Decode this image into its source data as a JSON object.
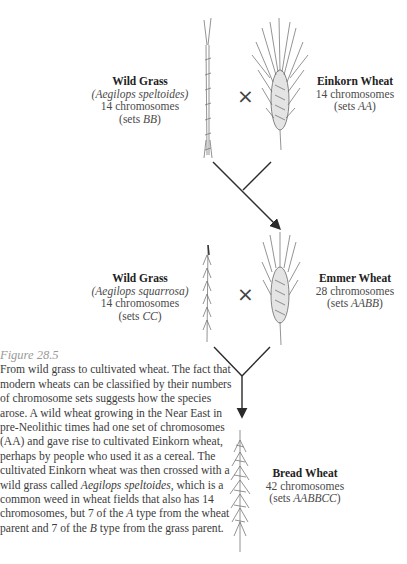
{
  "figure": {
    "number": "Figure 28.5",
    "caption_parts": [
      "From wild grass to cultivated wheat. The fact that modern wheats can be classified by their numbers of chromosome sets suggests how the species arose. A wild wheat growing in the Near East in pre-Neolithic times had one set of chromosomes (AA) and gave rise to cultivated Einkorn wheat, perhaps by people who used it as a cereal. The cultivated Einkorn wheat was then crossed with a wild grass called ",
      "Aegilops speltoides",
      ", which is a common weed in wheat fields that also has 14 chromosomes, but 7 of the ",
      "A",
      " type from the wheat parent and 7 of the ",
      "B",
      " type from the grass parent."
    ]
  },
  "cross_symbol": "×",
  "species": {
    "wild_grass_1": {
      "name": "Wild Grass",
      "scientific": "(Aegilops speltoides)",
      "chromosomes": "14 chromosomes",
      "sets_prefix": "(sets ",
      "sets": "BB",
      "sets_suffix": ")"
    },
    "einkorn": {
      "name": "Einkorn Wheat",
      "chromosomes": "14 chromosomes",
      "sets_prefix": "(sets ",
      "sets": "AA",
      "sets_suffix": ")"
    },
    "wild_grass_2": {
      "name": "Wild Grass",
      "scientific": "(Aegilops squarrosa)",
      "chromosomes": "14 chromosomes",
      "sets_prefix": "(sets ",
      "sets": "CC",
      "sets_suffix": ")"
    },
    "emmer": {
      "name": "Emmer Wheat",
      "chromosomes": "28 chromosomes",
      "sets_prefix": "(sets ",
      "sets": "AABB",
      "sets_suffix": ")"
    },
    "bread": {
      "name": "Bread Wheat",
      "chromosomes": "42 chromosomes",
      "sets_prefix": "(sets ",
      "sets": "AABBCC",
      "sets_suffix": ")"
    }
  },
  "colors": {
    "line": "#2a2a2a",
    "plant": "#6a6a6a",
    "figure_label": "#9a9a9a"
  }
}
